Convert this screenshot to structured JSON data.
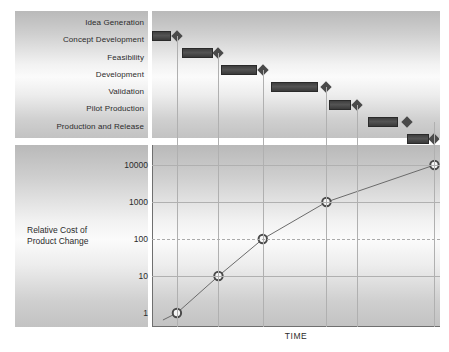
{
  "chart_data": [
    {
      "type": "bar",
      "subtype": "gantt",
      "title": "Product Development Phases",
      "xlabel": "",
      "ylabel": "",
      "categories": [
        "Idea Generation",
        "Concept Development",
        "Feasibility",
        "Development",
        "Validation",
        "Pilot Production",
        "Production and Release"
      ],
      "tasks": [
        {
          "label": "Idea Generation",
          "start": 0,
          "end": 7,
          "milestone": 9
        },
        {
          "label": "Concept Development",
          "start": 11,
          "end": 22,
          "milestone": 24
        },
        {
          "label": "Feasibility",
          "start": 25,
          "end": 38,
          "milestone": 40
        },
        {
          "label": "Development",
          "start": 43,
          "end": 60,
          "milestone": 63
        },
        {
          "label": "Validation",
          "start": 64,
          "end": 72,
          "milestone": 74
        },
        {
          "label": "Pilot Production",
          "start": 78,
          "end": 89,
          "milestone": 92
        },
        {
          "label": "Production and Release",
          "start": 92,
          "end": 100,
          "milestone": 102
        }
      ],
      "gridlines_x": [
        9,
        24,
        40,
        63,
        74,
        102
      ]
    },
    {
      "type": "line",
      "title": "Relative Cost of Product Change over Time",
      "xlabel": "TIME",
      "ylabel": "Relative Cost of\nProduct Change",
      "yscale": "log",
      "yticks": [
        "10000",
        "1000",
        "100",
        "10",
        "1"
      ],
      "ytick_values": [
        10000,
        1000,
        100,
        10,
        1
      ],
      "ylim": [
        1,
        10000
      ],
      "grid": true,
      "legend": "none",
      "x": [
        9,
        24,
        40,
        63,
        102
      ],
      "values": [
        1,
        10,
        100,
        1000,
        10000
      ],
      "markers": "circle-open"
    }
  ],
  "labels": {
    "tasks": [
      "Idea Generation",
      "Concept Development",
      "Feasibility",
      "Development",
      "Validation",
      "Pilot Production",
      "Production and Release"
    ],
    "y_axis_title": "Relative Cost of\nProduct Change",
    "x_axis_title": "TIME",
    "y_ticks": [
      "10000",
      "1000",
      "100",
      "10",
      "1"
    ]
  },
  "colors": {
    "bar_fill": "#4a4a4a",
    "bar_border": "#2a2a2a",
    "diamond": "#4a4a4a",
    "gridline": "#b0b0b0",
    "axis": "#6f6f6f",
    "line": "#6b6b6b",
    "marker_fill": "#f5f5f5",
    "marker_stroke": "#4a4a4a",
    "text": "#2b2b2b",
    "panel_light": "#fbfbfb",
    "panel_dark": "#b9b9b9"
  }
}
